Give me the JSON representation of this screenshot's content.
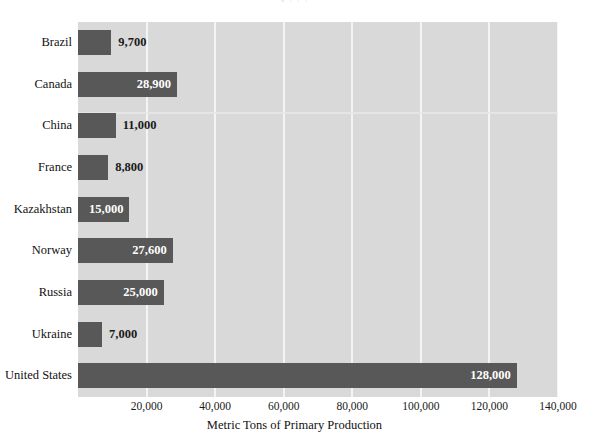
{
  "chart_data": {
    "type": "bar",
    "orientation": "horizontal",
    "title": "",
    "xlabel": "Metric Tons of Primary Production",
    "ylabel": "",
    "xlim": [
      0,
      140000
    ],
    "xticks": [
      20000,
      40000,
      60000,
      80000,
      100000,
      120000,
      140000
    ],
    "xtick_labels": [
      "20,000",
      "40,000",
      "60,000",
      "80,000",
      "100,000",
      "120,000",
      "140,000"
    ],
    "grid": "vertical",
    "legend": "none",
    "categories": [
      "Brazil",
      "Canada",
      "China",
      "France",
      "Kazakhstan",
      "Norway",
      "Russia",
      "Ukraine",
      "United States"
    ],
    "values": [
      9700,
      28900,
      11000,
      8800,
      15000,
      27600,
      25000,
      7000,
      128000
    ],
    "value_labels": [
      "9,700",
      "28,900",
      "11,000",
      "8,800",
      "15,000",
      "27,600",
      "25,000",
      "7,000",
      "128,000"
    ],
    "label_placement": [
      "outside",
      "inside",
      "outside",
      "outside",
      "inside",
      "inside",
      "inside",
      "outside",
      "inside"
    ],
    "bar_color": "#585858",
    "plot_background": "#d9d9d9",
    "gridline_color": "#f4f4f4",
    "value_label_inside_color": "#ffffff",
    "value_label_outside_color": "#1a1a1a",
    "axis_text_color": "#111111"
  },
  "title_remnant": "•  ·        ·              ·"
}
